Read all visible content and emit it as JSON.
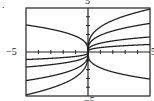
{
  "figure_label": ".",
  "axes": {
    "ytop": "5",
    "xleft": "−5",
    "xright": "5",
    "ybottom": "−5"
  },
  "chart_data": {
    "type": "line",
    "title": "",
    "xlabel": "",
    "ylabel": "",
    "xlim": [
      -5,
      5
    ],
    "ylim": [
      -5,
      5
    ],
    "grid": false,
    "tick_labels": {
      "x": [
        "-5",
        "5"
      ],
      "y": [
        "-5",
        "5"
      ]
    },
    "series": [
      {
        "name": "c=2.85",
        "c": 2.85
      },
      {
        "name": "c=1.9",
        "c": 1.9
      },
      {
        "name": "c=1",
        "c": 1.0
      },
      {
        "name": "c=0.5",
        "c": 0.5
      },
      {
        "name": "c=-1.8",
        "c": -1.8
      }
    ]
  }
}
